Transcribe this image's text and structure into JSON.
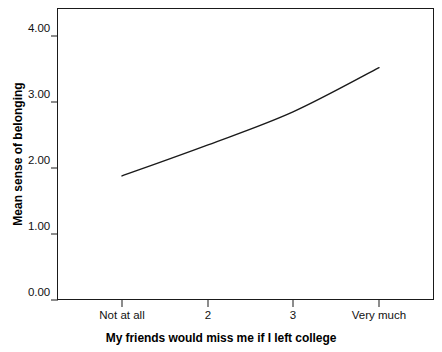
{
  "chart_data": {
    "type": "line",
    "title": "",
    "subtitle": "",
    "xlabel": "My friends would miss me if I left college",
    "ylabel": "Mean sense of belonging",
    "categories": [
      "Not at all",
      "2",
      "3",
      "Very much"
    ],
    "series": [
      {
        "name": "Mean sense of belonging",
        "values": [
          1.88,
          2.35,
          2.85,
          3.52
        ]
      }
    ],
    "ylim": [
      0.0,
      4.4
    ],
    "yticks": [
      0.0,
      1.0,
      2.0,
      3.0,
      4.0
    ],
    "ytick_labels": [
      "0.00",
      "1.00",
      "2.00",
      "3.00",
      "4.00"
    ],
    "grid": false,
    "legend": false,
    "legend_position": "none",
    "line_color": "#1a1a1a",
    "line_width": 1.4,
    "markers": false,
    "frame_color": "#1a1a1a",
    "background_color": "#ffffff"
  },
  "axes": {
    "y_title": "Mean sense of belonging",
    "x_title": "My friends would miss me if I left college",
    "y_tick_labels": [
      "4.00",
      "3.00",
      "2.00",
      "1.00",
      "0.00"
    ],
    "x_tick_labels": [
      "Not at all",
      "2",
      "3",
      "Very much"
    ]
  }
}
